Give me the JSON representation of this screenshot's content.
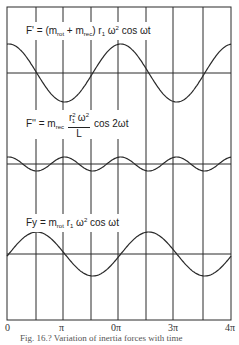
{
  "figure": {
    "caption": "Fig. 16.? Variation of inertia forces with time",
    "x_axis": {
      "tick_labels": [
        "0",
        "π",
        "0π",
        "3π",
        "4π"
      ],
      "range": [
        "0",
        "4π"
      ]
    },
    "panels": [
      {
        "name": "primary-force",
        "label_parts": {
          "lhs": "F' = (m",
          "sub1": "rot",
          "plus": " + m",
          "sub2": "rec",
          "mid": ") r",
          "sub3": "1",
          "omega": " ω",
          "sup": "2",
          "tail": " cos ωt"
        },
        "waveform": "cos ωt",
        "amplitude_px": 29
      },
      {
        "name": "secondary-force",
        "label_parts": {
          "lhs": "F'' = m",
          "sub1": "rec",
          "num_r": "r",
          "num_sub": "1",
          "num_sup": "2",
          "num_omega": " ω",
          "num_sup2": "2",
          "den": "L",
          "tail": "cos 2ωt"
        },
        "waveform": "cos 2ωt",
        "amplitude_px": 7
      },
      {
        "name": "vertical-force",
        "label_parts": {
          "lhs": "Fy = m",
          "sub1": "rot",
          "mid": " r",
          "sub2": "1",
          "omega": " ω",
          "sup": "2",
          "tail": " cos ωt"
        },
        "waveform": "sin-shaped cos ωt",
        "amplitude_px": 22
      }
    ],
    "colors": {
      "line": "#2a2a2a",
      "background": "#ffffff"
    }
  }
}
